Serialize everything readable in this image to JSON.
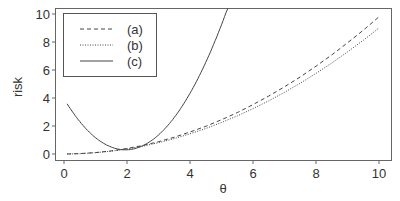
{
  "chart_data": {
    "type": "line",
    "title": "",
    "xlabel": "θ",
    "ylabel": "risk",
    "xlim": [
      0,
      10
    ],
    "ylim": [
      0,
      10
    ],
    "x_ticks": [
      "0",
      "2",
      "4",
      "6",
      "8",
      "10"
    ],
    "y_ticks": [
      "0",
      "2",
      "4",
      "6",
      "8",
      "10"
    ],
    "grid": false,
    "legend_position": "top-left",
    "x": [
      0.1,
      0.5,
      1.0,
      1.5,
      2.0,
      2.5,
      3.0,
      3.5,
      4.0,
      4.5,
      5.0,
      5.15,
      5.5,
      6.0,
      6.5,
      7.0,
      7.5,
      8.0,
      8.5,
      9.0,
      9.5,
      10.0
    ],
    "series": [
      {
        "name": "(a)",
        "style": "dashed",
        "values": [
          0.0,
          0.03,
          0.1,
          0.22,
          0.39,
          0.61,
          0.88,
          1.2,
          1.57,
          1.98,
          2.45,
          2.6,
          2.96,
          3.53,
          4.14,
          4.8,
          5.51,
          6.27,
          7.08,
          7.94,
          8.84,
          9.8
        ]
      },
      {
        "name": "(b)",
        "style": "dotted",
        "values": [
          0.0,
          0.02,
          0.09,
          0.2,
          0.36,
          0.56,
          0.81,
          1.1,
          1.44,
          1.82,
          2.25,
          2.39,
          2.72,
          3.24,
          3.8,
          4.41,
          5.06,
          5.76,
          6.5,
          7.29,
          8.12,
          9.0
        ]
      },
      {
        "name": "(c)",
        "style": "solid",
        "values": [
          3.6,
          2.33,
          1.32,
          0.49,
          0.3,
          0.59,
          1.36,
          2.6,
          4.33,
          6.54,
          9.23,
          10.0,
          null,
          null,
          null,
          null,
          null,
          null,
          null,
          null,
          null,
          null
        ]
      }
    ],
    "legend": [
      "(a)",
      "(b)",
      "(c)"
    ]
  },
  "colors": {
    "line": "#444444",
    "axis": "#555555",
    "text": "#333333"
  }
}
